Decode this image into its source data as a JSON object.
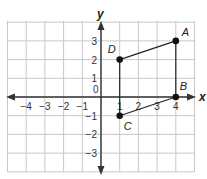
{
  "chart_data": {
    "type": "scatter",
    "title": "",
    "xlabel": "x",
    "ylabel": "y",
    "origin_label": "0",
    "xlim": [
      -5,
      5
    ],
    "ylim": [
      -4,
      4
    ],
    "grid": true,
    "x_ticks": [
      -4,
      -3,
      -2,
      -1,
      1,
      2,
      3,
      4
    ],
    "y_ticks": [
      3,
      2,
      1,
      -1,
      -2,
      -3
    ],
    "x_tick_labels": [
      "−4",
      "−3",
      "−2",
      "−1",
      "1",
      "2",
      "3",
      "4"
    ],
    "y_tick_labels": [
      "3",
      "2",
      "1",
      "−1",
      "−2",
      "−3"
    ],
    "points": [
      {
        "label": "A",
        "x": 4,
        "y": 3
      },
      {
        "label": "B",
        "x": 4,
        "y": 0
      },
      {
        "label": "C",
        "x": 1,
        "y": -1
      },
      {
        "label": "D",
        "x": 1,
        "y": 2
      }
    ],
    "segments": [
      [
        "D",
        "A"
      ],
      [
        "A",
        "B"
      ],
      [
        "B",
        "C"
      ],
      [
        "C",
        "D"
      ]
    ],
    "colors": {
      "grid": "#c8c8c8",
      "axis": "#333333",
      "point": "#111111",
      "text": "#333333"
    }
  }
}
